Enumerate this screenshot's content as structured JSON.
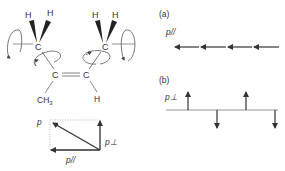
{
  "molecule": {
    "atoms": {
      "c_methyl_left": "C",
      "c_methyl_right": "C",
      "c_double_left": "C",
      "c_double_right": "C",
      "h_left_1": "H",
      "h_left_2": "H",
      "h_right_1": "H",
      "h_right_2": "H",
      "substituent_ch3": "CH",
      "substituent_ch3_sub": "3",
      "substituent_h": "H"
    }
  },
  "vector_decomposition": {
    "p": "p",
    "p_perp": "p⊥",
    "p_parallel": "p//"
  },
  "panel_a": {
    "label": "(a)",
    "vector_label": "p//",
    "arrow_count": 4,
    "direction": "left"
  },
  "panel_b": {
    "label": "(b)",
    "vector_label": "p⊥",
    "arrows": [
      "up",
      "down",
      "up",
      "down"
    ]
  },
  "colors": {
    "line": "#333333",
    "dotted": "#999999",
    "orbit": "#555555"
  }
}
